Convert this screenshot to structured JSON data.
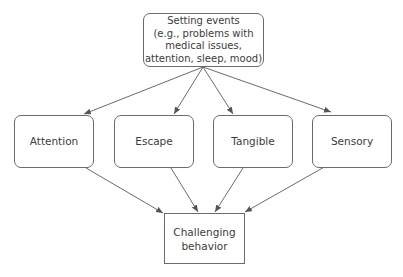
{
  "diagram": {
    "top_node": {
      "label_lines": [
        "Setting events",
        "(e.g., problems with",
        "medical issues,",
        "attention, sleep, mood)"
      ]
    },
    "middle_nodes": [
      {
        "label": "Attention"
      },
      {
        "label": "Escape"
      },
      {
        "label": "Tangible"
      },
      {
        "label": "Sensory"
      }
    ],
    "bottom_node": {
      "label_lines": [
        "Challenging",
        "behavior"
      ]
    },
    "edges": [
      {
        "from": "Setting events",
        "to": "Attention"
      },
      {
        "from": "Setting events",
        "to": "Escape"
      },
      {
        "from": "Setting events",
        "to": "Tangible"
      },
      {
        "from": "Setting events",
        "to": "Sensory"
      },
      {
        "from": "Attention",
        "to": "Challenging behavior"
      },
      {
        "from": "Escape",
        "to": "Challenging behavior"
      },
      {
        "from": "Tangible",
        "to": "Challenging behavior"
      },
      {
        "from": "Sensory",
        "to": "Challenging behavior"
      }
    ],
    "colors": {
      "line": "#6b6b6b",
      "text": "#3c3c3c",
      "background": "#ffffff"
    }
  }
}
